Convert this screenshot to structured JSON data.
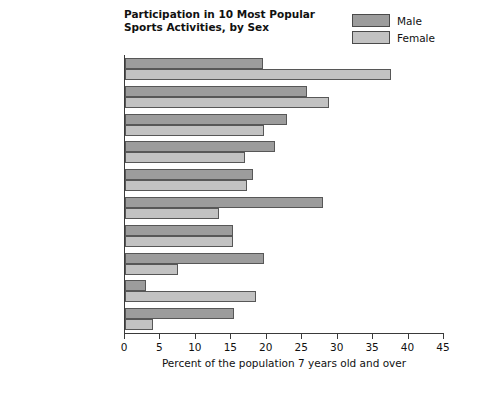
{
  "chart_data": {
    "type": "bar",
    "orientation": "horizontal",
    "title": "Participation in 10 Most Popular Sports Activities, by Sex",
    "title_lines": [
      "Participation in 10 Most Popular",
      "Sports Activities, by Sex"
    ],
    "xlabel": "Percent of the population 7 years old and over",
    "ylabel": "",
    "xlim": [
      0,
      45
    ],
    "xticks": [
      0,
      5,
      10,
      15,
      20,
      25,
      30,
      35,
      40,
      45
    ],
    "grid": false,
    "legend_position": "top-right",
    "categories": [
      "Exercise walking",
      "Swimming",
      "Bicycle riding",
      "Camping",
      "Bowling",
      "Fishing (freshwater)",
      "Exercising with equipment",
      "Basketball",
      "Aerobics",
      "Golf"
    ],
    "category_lines": [
      [
        "Exercise walking"
      ],
      [
        "Swimming"
      ],
      [
        "Bicycle riding"
      ],
      [
        "Camping"
      ],
      [
        "Bowling"
      ],
      [
        "Fishing (freshwater)"
      ],
      [
        "Exercising with",
        "equipment"
      ],
      [
        "Basketball"
      ],
      [
        "Aerobics"
      ],
      [
        "Golf"
      ]
    ],
    "series": [
      {
        "name": "Male",
        "color": "#9c9c9c",
        "values": [
          19.5,
          25.7,
          22.8,
          21.2,
          18.0,
          27.9,
          15.2,
          19.6,
          3.0,
          15.4
        ]
      },
      {
        "name": "Female",
        "color": "#c2c2c2",
        "values": [
          37.5,
          28.8,
          19.6,
          16.9,
          17.2,
          13.3,
          15.2,
          7.5,
          18.5,
          4.0
        ]
      }
    ]
  },
  "legend": {
    "items": [
      {
        "label": "Male",
        "color": "#9c9c9c"
      },
      {
        "label": "Female",
        "color": "#c2c2c2"
      }
    ]
  }
}
